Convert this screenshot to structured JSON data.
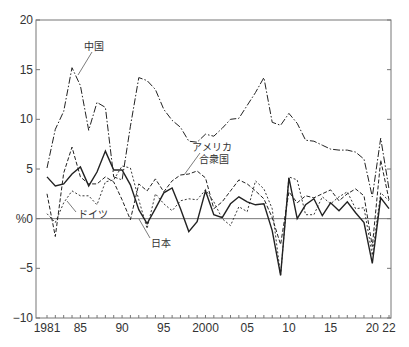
{
  "chart_data": {
    "type": "line",
    "title": "",
    "xlabel": "",
    "ylabel": "%",
    "ylim": [
      -10,
      20
    ],
    "xlim": [
      1981,
      2022
    ],
    "yticks": [
      20,
      15,
      10,
      5,
      0,
      -5,
      -10
    ],
    "ytick_labels": [
      "20",
      "15",
      "10",
      "5",
      "%0",
      "−5",
      "−10"
    ],
    "xtick_labels": [
      {
        "year": 1981,
        "label": "1981"
      },
      {
        "year": 1985,
        "label": "85"
      },
      {
        "year": 1990,
        "label": "90"
      },
      {
        "year": 1995,
        "label": "95"
      },
      {
        "year": 2000,
        "label": "2000"
      },
      {
        "year": 2005,
        "label": "05"
      },
      {
        "year": 2010,
        "label": "10"
      },
      {
        "year": 2015,
        "label": "15"
      },
      {
        "year": 2020,
        "label": "20"
      },
      {
        "year": 2022,
        "label": "22"
      }
    ],
    "x": [
      1981,
      1982,
      1983,
      1984,
      1985,
      1986,
      1987,
      1988,
      1989,
      1990,
      1991,
      1992,
      1993,
      1994,
      1995,
      1996,
      1997,
      1998,
      1999,
      2000,
      2001,
      2002,
      2003,
      2004,
      2005,
      2006,
      2007,
      2008,
      2009,
      2010,
      2011,
      2012,
      2013,
      2014,
      2015,
      2016,
      2017,
      2018,
      2019,
      2020,
      2021,
      2022
    ],
    "series": [
      {
        "name": "中国",
        "style": "dash-dot",
        "values": [
          5.1,
          9.0,
          10.8,
          15.2,
          13.4,
          8.9,
          11.7,
          11.2,
          4.2,
          3.9,
          9.3,
          14.2,
          13.9,
          13.0,
          11.0,
          9.9,
          9.2,
          7.8,
          7.7,
          8.5,
          8.3,
          9.1,
          10.0,
          10.1,
          11.4,
          12.7,
          14.2,
          9.7,
          9.4,
          10.6,
          9.6,
          7.9,
          7.8,
          7.4,
          7.0,
          6.9,
          6.9,
          6.7,
          6.0,
          2.2,
          8.1,
          3.0
        ]
      },
      {
        "name": "アメリカ合衆国",
        "style": "dashed",
        "values": [
          2.5,
          -1.8,
          4.6,
          7.2,
          4.2,
          3.5,
          3.5,
          4.2,
          3.7,
          1.9,
          -0.1,
          3.5,
          2.8,
          4.0,
          2.7,
          3.8,
          4.4,
          4.5,
          4.8,
          4.1,
          1.0,
          1.7,
          2.8,
          3.9,
          3.5,
          2.8,
          2.0,
          0.1,
          -2.6,
          2.7,
          1.6,
          2.3,
          2.1,
          2.5,
          2.9,
          1.8,
          2.5,
          3.0,
          2.3,
          -2.8,
          5.9,
          1.9
        ]
      },
      {
        "name": "ドイツ",
        "style": "fine-dashed",
        "values": [
          0.5,
          -0.4,
          1.6,
          2.8,
          2.3,
          2.3,
          1.4,
          3.7,
          3.9,
          5.3,
          5.1,
          1.9,
          -1.0,
          2.5,
          1.5,
          0.8,
          1.8,
          2.0,
          1.9,
          2.9,
          1.7,
          0.0,
          -0.7,
          1.2,
          0.7,
          3.8,
          3.0,
          1.0,
          -5.7,
          4.2,
          3.9,
          0.4,
          0.4,
          2.2,
          1.5,
          2.2,
          2.7,
          1.0,
          1.1,
          -3.7,
          2.6,
          1.8
        ]
      },
      {
        "name": "日本",
        "style": "solid",
        "values": [
          4.2,
          3.3,
          3.5,
          4.5,
          5.2,
          3.3,
          4.7,
          6.8,
          4.9,
          4.9,
          3.4,
          0.9,
          -0.5,
          1.0,
          2.6,
          3.1,
          1.0,
          -1.3,
          -0.3,
          2.8,
          0.4,
          0.1,
          1.5,
          2.2,
          1.7,
          1.4,
          1.5,
          -1.2,
          -5.7,
          4.1,
          0.0,
          1.4,
          2.0,
          0.3,
          1.6,
          0.8,
          1.7,
          0.6,
          -0.4,
          -4.5,
          2.1,
          1.0
        ]
      }
    ],
    "annotations": [
      {
        "text": "中国",
        "x": 84,
        "y": 50
      },
      {
        "text": "アメリカ",
        "x": 192,
        "y": 151
      },
      {
        "text": "合衆国",
        "x": 199,
        "y": 163
      },
      {
        "text": "ドイツ",
        "x": 78,
        "y": 218
      },
      {
        "text": "日本",
        "x": 151,
        "y": 247
      }
    ],
    "grid": false,
    "legend": "inline labels"
  }
}
